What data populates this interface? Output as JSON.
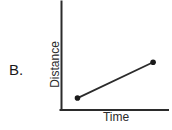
{
  "figure": {
    "choice_label": "B.",
    "axis_color": "#2b2b2b",
    "line_color": "#2b2b2b",
    "marker_color": "#1a1a1a",
    "background_color": "#ffffff"
  },
  "chart_data": {
    "type": "line",
    "title": "",
    "subtitle": "",
    "xlabel": "Time",
    "ylabel": "Distance",
    "x": [
      0.15,
      0.86
    ],
    "values": [
      0.11,
      0.44
    ],
    "series": [
      {
        "name": "distance vs time",
        "x": [
          0.15,
          0.86
        ],
        "values": [
          0.11,
          0.44
        ]
      }
    ],
    "xlim": [
      0,
      1
    ],
    "ylim": [
      0,
      1
    ],
    "xticklabels": [],
    "yticklabels": [],
    "grid": false,
    "legend": false,
    "legend_position": "none",
    "markers": true,
    "annotations": [
      "B."
    ]
  }
}
